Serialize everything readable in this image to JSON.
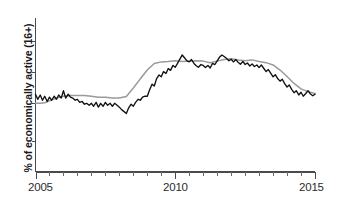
{
  "chart_data": {
    "type": "line",
    "title": "",
    "subtitle": "",
    "xlabel": "",
    "ylabel": "% of economically active (16+)",
    "grid": false,
    "legend": "none",
    "xlim": [
      2005.0,
      2015.0
    ],
    "ylim": [
      0.0,
      10.0
    ],
    "x_tick_labels": [
      "2005",
      "2010",
      "2015"
    ],
    "x_major_ticks": [
      2005,
      2010,
      2015
    ],
    "x_minor_ticks": [
      2005.5,
      2006,
      2006.5,
      2007,
      2007.5,
      2008,
      2008.5,
      2009,
      2009.5,
      2010.5,
      2011,
      2011.5,
      2012,
      2012.5,
      2013,
      2013.5,
      2014,
      2014.5
    ],
    "y_tick_labels": [],
    "y_ticks_unlabeled": [
      2.0,
      4.5,
      6.5,
      8.5
    ],
    "annotations": [],
    "series": [
      {
        "name": "black-series",
        "color": "#111111",
        "x": [
          2005.0,
          2005.08,
          2005.17,
          2005.25,
          2005.33,
          2005.42,
          2005.5,
          2005.58,
          2005.67,
          2005.75,
          2005.83,
          2005.92,
          2006.0,
          2006.08,
          2006.17,
          2006.25,
          2006.33,
          2006.42,
          2006.5,
          2006.58,
          2006.67,
          2006.75,
          2006.83,
          2006.92,
          2007.0,
          2007.08,
          2007.17,
          2007.25,
          2007.33,
          2007.42,
          2007.5,
          2007.58,
          2007.67,
          2007.75,
          2007.83,
          2007.92,
          2008.0,
          2008.08,
          2008.17,
          2008.25,
          2008.33,
          2008.42,
          2008.5,
          2008.58,
          2008.67,
          2008.75,
          2008.83,
          2008.92,
          2009.0,
          2009.08,
          2009.17,
          2009.25,
          2009.33,
          2009.42,
          2009.5,
          2009.58,
          2009.67,
          2009.75,
          2009.83,
          2009.92,
          2010.0,
          2010.08,
          2010.17,
          2010.25,
          2010.33,
          2010.42,
          2010.5,
          2010.58,
          2010.67,
          2010.75,
          2010.83,
          2010.92,
          2011.0,
          2011.08,
          2011.17,
          2011.25,
          2011.33,
          2011.42,
          2011.5,
          2011.58,
          2011.67,
          2011.75,
          2011.83,
          2011.92,
          2012.0,
          2012.08,
          2012.17,
          2012.25,
          2012.33,
          2012.42,
          2012.5,
          2012.58,
          2012.67,
          2012.75,
          2012.83,
          2012.92,
          2013.0,
          2013.08,
          2013.17,
          2013.25,
          2013.33,
          2013.42,
          2013.5,
          2013.58,
          2013.67,
          2013.75,
          2013.83,
          2013.92,
          2014.0,
          2014.08,
          2014.17,
          2014.25,
          2014.33,
          2014.42,
          2014.5,
          2014.58,
          2014.67,
          2014.75,
          2014.83,
          2014.92,
          2015.0
        ],
        "y": [
          5.05,
          4.72,
          5.0,
          4.66,
          4.92,
          4.58,
          4.86,
          4.66,
          4.92,
          4.72,
          5.0,
          4.8,
          5.28,
          4.8,
          5.05,
          4.86,
          4.8,
          4.66,
          4.72,
          4.52,
          4.58,
          4.4,
          4.46,
          4.33,
          4.46,
          4.27,
          4.52,
          4.21,
          4.46,
          4.27,
          4.52,
          4.33,
          4.46,
          4.27,
          4.46,
          4.33,
          4.21,
          4.05,
          3.92,
          3.8,
          4.15,
          4.4,
          4.27,
          4.52,
          4.72,
          4.66,
          4.86,
          4.92,
          4.92,
          5.32,
          5.7,
          5.58,
          6.05,
          6.3,
          6.18,
          6.52,
          6.4,
          6.72,
          6.6,
          6.92,
          6.8,
          7.05,
          7.35,
          7.6,
          7.42,
          7.22,
          7.15,
          7.3,
          7.05,
          6.9,
          6.8,
          6.98,
          6.92,
          6.78,
          6.92,
          6.75,
          7.05,
          6.98,
          7.22,
          7.45,
          7.6,
          7.5,
          7.38,
          7.22,
          7.32,
          7.15,
          7.3,
          7.12,
          7.0,
          7.18,
          6.98,
          7.08,
          6.88,
          7.02,
          6.85,
          6.95,
          6.78,
          6.95,
          6.72,
          6.52,
          6.65,
          6.4,
          6.18,
          6.32,
          6.05,
          5.9,
          6.02,
          5.72,
          5.52,
          5.65,
          5.35,
          5.15,
          5.28,
          5.0,
          5.18,
          4.92,
          5.1,
          5.28,
          5.08,
          4.95,
          5.05
        ]
      },
      {
        "name": "gray-series",
        "color": "#9a9a9a",
        "x": [
          2005.0,
          2005.17,
          2005.33,
          2005.5,
          2005.75,
          2006.0,
          2006.25,
          2006.5,
          2006.75,
          2007.0,
          2007.25,
          2007.5,
          2007.75,
          2008.0,
          2008.25,
          2008.5,
          2008.75,
          2009.0,
          2009.25,
          2009.5,
          2009.75,
          2010.0,
          2010.25,
          2010.5,
          2010.75,
          2011.0,
          2011.25,
          2011.5,
          2011.75,
          2012.0,
          2012.25,
          2012.5,
          2012.75,
          2013.0,
          2013.25,
          2013.5,
          2013.75,
          2014.0,
          2014.25,
          2014.5,
          2014.75,
          2015.0
        ],
        "y": [
          4.46,
          4.46,
          4.5,
          4.62,
          4.8,
          4.92,
          4.96,
          4.96,
          4.96,
          4.92,
          4.86,
          4.86,
          4.8,
          4.8,
          4.9,
          5.45,
          6.05,
          6.62,
          7.05,
          7.15,
          7.18,
          7.22,
          7.18,
          7.2,
          7.22,
          7.2,
          7.1,
          7.2,
          7.3,
          7.35,
          7.28,
          7.22,
          7.28,
          7.18,
          7.1,
          6.95,
          6.62,
          6.2,
          5.75,
          5.4,
          5.22,
          5.1
        ]
      }
    ]
  },
  "axes": {
    "y_axis_label": "% of economically active (16+)",
    "x_labels": {
      "start": "2005",
      "middle": "2010",
      "end": "2015"
    }
  }
}
